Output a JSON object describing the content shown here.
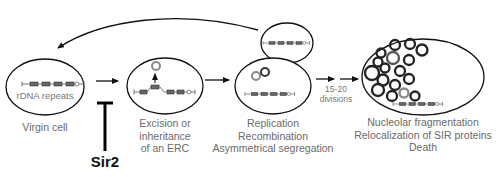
{
  "figure": {
    "stages": [
      {
        "id": "virgin",
        "inner_label": "rDNA repeats",
        "caption": [
          "Virgin cell"
        ]
      },
      {
        "id": "excision",
        "caption": [
          "Excision or",
          "inheritance",
          "of an ERC"
        ]
      },
      {
        "id": "replication",
        "caption": [
          "Replication",
          "Recombination",
          "Asymmetrical segregation"
        ]
      },
      {
        "id": "old",
        "caption": [
          "Nucleolar fragmentation",
          "Relocalization of SIR proteins",
          "Death"
        ]
      }
    ],
    "division_label": [
      "15-20",
      "divisions"
    ],
    "inhibitor": {
      "label": "Sir2",
      "target": "excision"
    },
    "daughter_cell": {
      "returns_to": "virgin"
    }
  }
}
